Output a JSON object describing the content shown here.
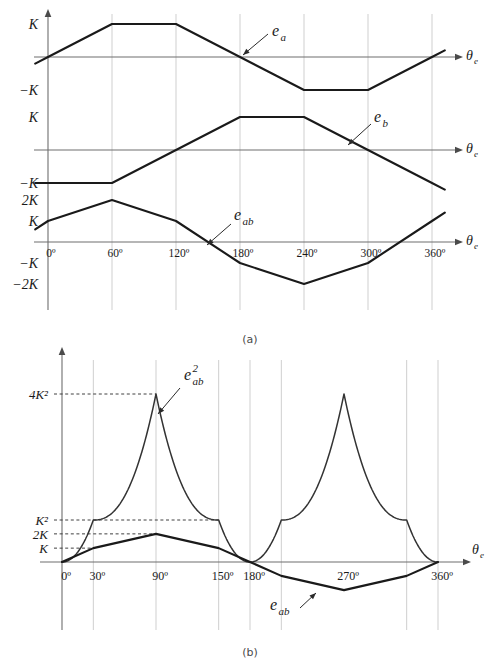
{
  "figure": {
    "caption_a": "(a)",
    "caption_b": "(b)"
  },
  "chart_data": [
    {
      "id": "panel-a",
      "type": "line",
      "title": "",
      "subtitle": "",
      "xlabel": "θe",
      "ylabel": "",
      "grid": true,
      "gridlines_x": [
        0,
        60,
        120,
        180,
        240,
        300,
        360
      ],
      "legend_position": "inline-annotations",
      "xlim": [
        -15,
        378
      ],
      "xticks": [
        0,
        60,
        120,
        180,
        240,
        300,
        360
      ],
      "xtick_labels": [
        "0º",
        "60º",
        "120º",
        "180º",
        "240º",
        "300º",
        "360º"
      ],
      "subplots": [
        {
          "name": "ea",
          "annotation": "e",
          "annotation_sub": "a",
          "ylabels": [
            "K",
            "−K"
          ],
          "yticks": [
            1,
            -1
          ],
          "ylim": [
            -1.45,
            1.45
          ],
          "series": [
            {
              "name": "e_a",
              "x": [
                -12,
                0,
                30,
                60,
                120,
                150,
                180,
                210,
                240,
                300,
                330,
                360,
                372
              ],
              "y": [
                -0.2,
                0.0,
                0.5,
                1.0,
                1.0,
                0.5,
                0.0,
                -0.5,
                -1.0,
                -1.0,
                -0.5,
                0.0,
                0.2
              ]
            }
          ]
        },
        {
          "name": "eb",
          "annotation": "e",
          "annotation_sub": "b",
          "ylabels": [
            "K",
            "−K"
          ],
          "yticks": [
            1,
            -1
          ],
          "ylim": [
            -1.45,
            1.45
          ],
          "series": [
            {
              "name": "e_b",
              "x": [
                -12,
                0,
                60,
                120,
                180,
                240,
                300,
                360,
                372
              ],
              "y": [
                -1.0,
                -1.0,
                -1.0,
                0.0,
                1.0,
                1.0,
                0.0,
                -1.0,
                -1.2
              ]
            }
          ]
        },
        {
          "name": "eab",
          "annotation": "e",
          "annotation_sub": "ab",
          "ylabels": [
            "2K",
            "K",
            "−K",
            "−2K"
          ],
          "yticks": [
            2,
            1,
            -1,
            -2
          ],
          "ylim": [
            -2.5,
            2.5
          ],
          "series": [
            {
              "name": "e_ab",
              "x": [
                -12,
                0,
                60,
                120,
                180,
                240,
                300,
                360,
                372
              ],
              "y": [
                0.6,
                1.0,
                2.0,
                1.0,
                -1.0,
                -2.0,
                -1.0,
                1.0,
                1.4
              ]
            }
          ]
        }
      ]
    },
    {
      "id": "panel-b",
      "type": "line",
      "title": "",
      "subtitle": "",
      "xlabel": "θe",
      "ylabel": "",
      "grid": true,
      "legend_position": "inline-annotations",
      "xlim": [
        -8,
        382
      ],
      "ylim": [
        -1.35,
        4.35
      ],
      "xticks": [
        0,
        30,
        90,
        150,
        180,
        270,
        360
      ],
      "xtick_labels": [
        "0º",
        "30º",
        "90º",
        "150º",
        "180º",
        "270º",
        "360º"
      ],
      "gridlines_x": [
        30,
        90,
        150,
        180,
        210,
        330,
        360
      ],
      "yticks": [
        4,
        1,
        0.67,
        0.33
      ],
      "ytick_labels": [
        "4K²",
        "K²",
        "2K",
        "K"
      ],
      "ytick_has_leader": [
        true,
        true,
        true,
        true
      ],
      "series": [
        {
          "name": "e_ab_squared",
          "annotation": "e",
          "annotation_sub": "ab",
          "annotation_sup": "2",
          "peak_value": 4,
          "plateau_value": 1,
          "description": "squared line-to-line back-EMF, cusped peaks at 90º and 270º reaching 4K², shoulders at K² between 30º-150º and 210º-330º, zero at 0º, 180º and 360º"
        },
        {
          "name": "e_ab",
          "annotation": "e",
          "annotation_sub": "ab",
          "description": "line-to-line back-EMF, trapezoid peaking at 2K at 90º and −2K at 270º, zero crossings at 0º, 180º, 360º",
          "x": [
            0,
            30,
            90,
            150,
            180,
            210,
            270,
            330,
            360
          ],
          "y": [
            0,
            0.33,
            0.67,
            0.33,
            0,
            -0.33,
            -0.67,
            -0.33,
            0
          ]
        }
      ]
    }
  ]
}
